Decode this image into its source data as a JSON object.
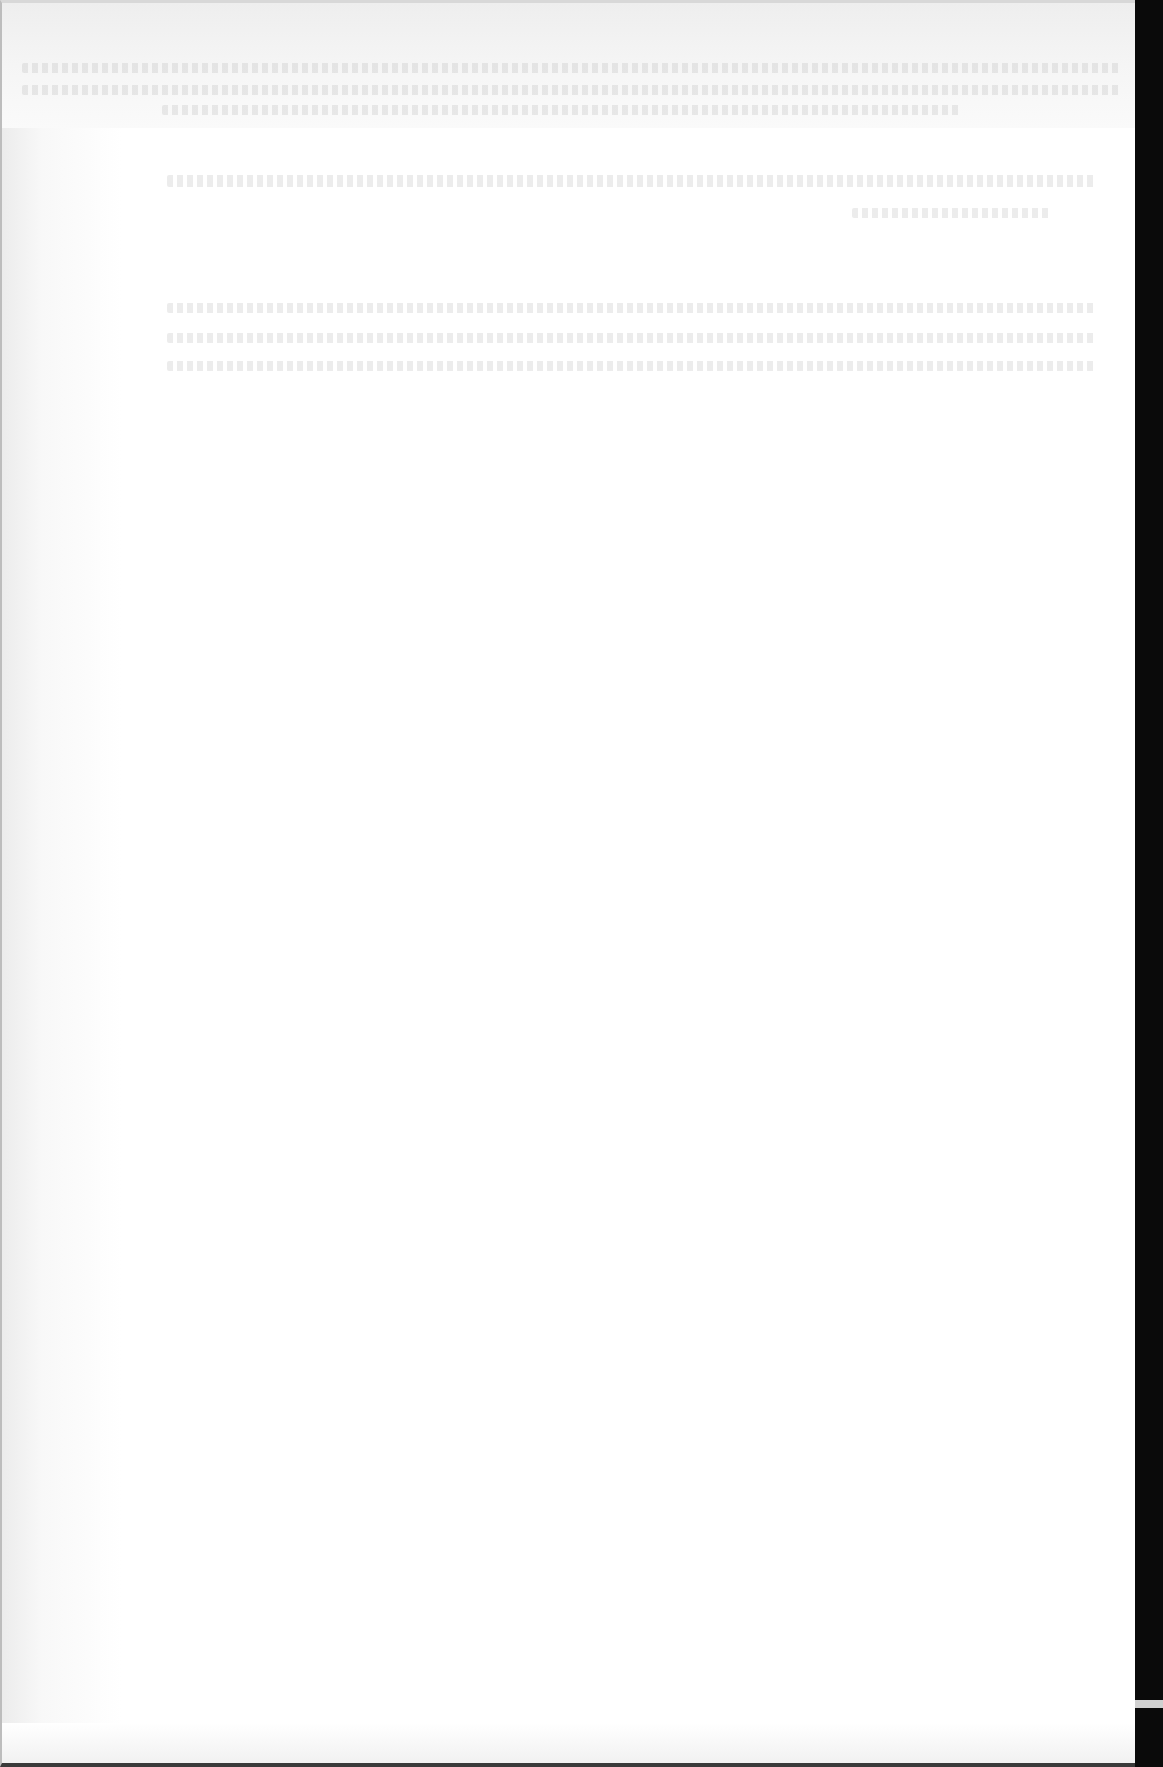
{
  "document": {
    "type": "scanned page",
    "legibility": "illegible (severely faded scan)",
    "text_lines": [
      {
        "id": "line-1",
        "text": ""
      },
      {
        "id": "line-2",
        "text": ""
      },
      {
        "id": "line-3",
        "text": ""
      },
      {
        "id": "line-4",
        "text": ""
      },
      {
        "id": "line-5",
        "text": ""
      },
      {
        "id": "line-6",
        "text": ""
      },
      {
        "id": "line-7",
        "text": ""
      },
      {
        "id": "line-8",
        "text": ""
      }
    ]
  },
  "colors": {
    "paper": "#ffffff",
    "scan_border": "#0a0a0a",
    "faded_text": "#c8c8c8"
  }
}
